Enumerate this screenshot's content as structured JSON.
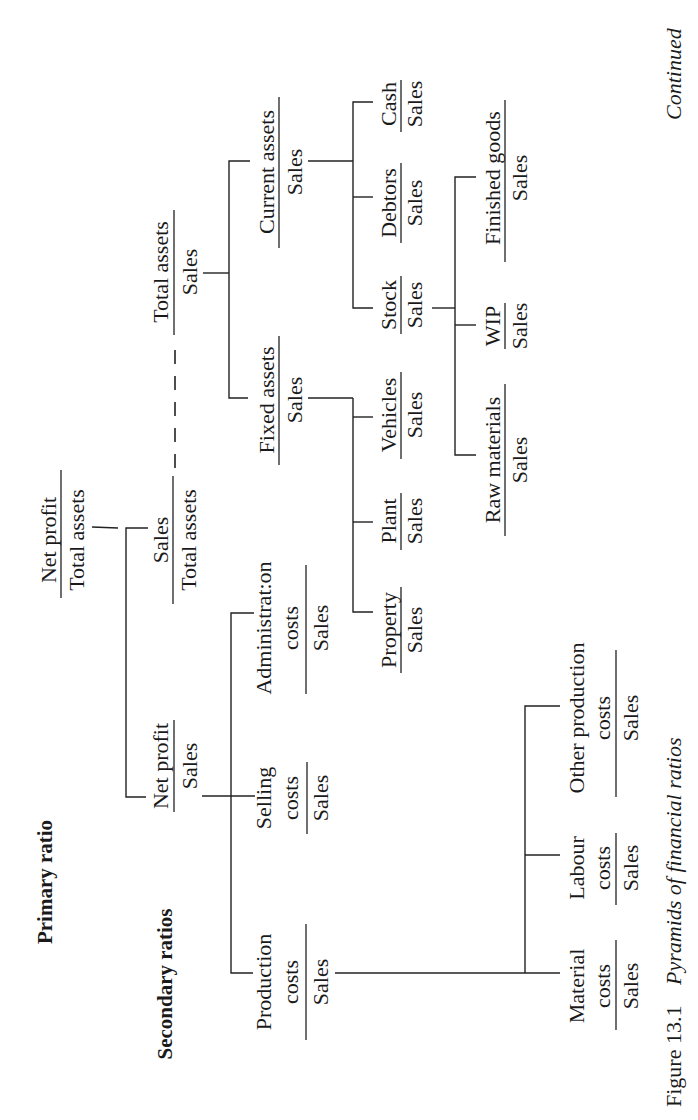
{
  "page": {
    "orientation": "rotated-90-ccw",
    "continued_label": "Continued"
  },
  "caption": {
    "figure_number": "Figure 13.1",
    "title": "Pyramids of financial ratios"
  },
  "levels": {
    "primary": "Primary ratio",
    "secondary": "Secondary ratios"
  },
  "nodes": {
    "net_profit_total_assets": {
      "numerator": "Net profit",
      "denominator": "Total assets"
    },
    "sales_total_assets": {
      "numerator": "Sales",
      "denominator": "Total assets"
    },
    "net_profit_sales": {
      "numerator": "Net profit",
      "denominator": "Sales"
    },
    "total_assets_sales": {
      "numerator": "Total assets",
      "denominator": "Sales"
    },
    "fixed_assets_sales": {
      "numerator": "Fixed assets",
      "denominator": "Sales"
    },
    "current_assets_sales": {
      "numerator": "Current assets",
      "denominator": "Sales"
    },
    "property_sales": {
      "numerator": "Property",
      "denominator": "Sales"
    },
    "plant_sales": {
      "numerator": "Plant",
      "denominator": "Sales"
    },
    "vehicles_sales": {
      "numerator": "Vehicles",
      "denominator": "Sales"
    },
    "stock_sales": {
      "numerator": "Stock",
      "denominator": "Sales"
    },
    "debtors_sales": {
      "numerator": "Debtors",
      "denominator": "Sales"
    },
    "cash_sales": {
      "numerator": "Cash",
      "denominator": "Sales"
    },
    "raw_materials_sales": {
      "numerator": "Raw materials",
      "denominator": "Sales"
    },
    "wip_sales": {
      "numerator": "WIP",
      "denominator": "Sales"
    },
    "finished_goods_sales": {
      "numerator": "Finished goods",
      "denominator": "Sales"
    },
    "production_costs_sales": {
      "numerator_line1": "Production",
      "numerator_line2": "costs",
      "denominator": "Sales"
    },
    "selling_costs_sales": {
      "numerator_line1": "Selling",
      "numerator_line2": "costs",
      "denominator": "Sales"
    },
    "administration_costs_sales": {
      "numerator_line1": "Administrat:on",
      "numerator_line2": "costs",
      "denominator": "Sales"
    },
    "material_costs_sales": {
      "numerator_line1": "Material",
      "numerator_line2": "costs",
      "denominator": "Sales"
    },
    "labour_costs_sales": {
      "numerator_line1": "Labour",
      "numerator_line2": "costs",
      "denominator": "Sales"
    },
    "other_production_costs_sales": {
      "numerator_line1": "Other production",
      "numerator_line2": "costs",
      "denominator": "Sales"
    }
  }
}
